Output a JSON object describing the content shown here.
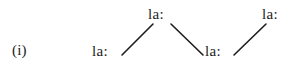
{
  "figure": {
    "item_label": "(i)",
    "background_color": "#ffffff",
    "ink_color": "#1c1c1c",
    "width": 302,
    "height": 70
  },
  "syllables": [
    {
      "id": "syllable-1",
      "text": "la:",
      "level": "low",
      "x": 92,
      "y": 43
    },
    {
      "id": "syllable-2",
      "text": "la:",
      "level": "high",
      "x": 148,
      "y": 6
    },
    {
      "id": "syllable-3",
      "text": "la:",
      "level": "low",
      "x": 205,
      "y": 43
    },
    {
      "id": "syllable-4",
      "text": "la:",
      "level": "high",
      "x": 262,
      "y": 6
    }
  ],
  "contour": {
    "type": "pitch-contour",
    "segments": [
      {
        "id": "rise-1",
        "direction": "rise",
        "x1": 122,
        "y1": 55,
        "x2": 153,
        "y2": 24
      },
      {
        "id": "fall-1",
        "direction": "fall",
        "x1": 171,
        "y1": 24,
        "x2": 203,
        "y2": 55
      },
      {
        "id": "rise-2",
        "direction": "rise",
        "x1": 234,
        "y1": 55,
        "x2": 266,
        "y2": 24
      }
    ],
    "stroke_color": "#1c1c1c",
    "stroke_width": 1.6
  }
}
